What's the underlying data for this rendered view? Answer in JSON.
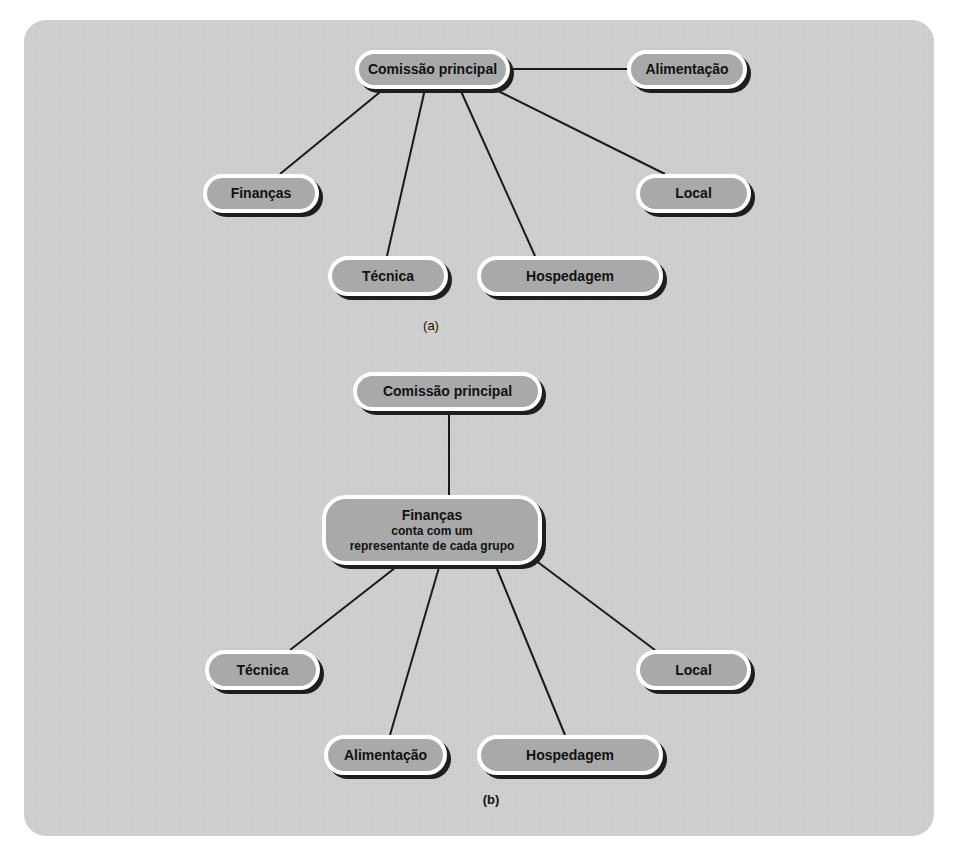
{
  "diagram_a": {
    "caption": "(a)",
    "nodes": {
      "root": "Comissão principal",
      "alimentacao": "Alimentação",
      "financas": "Finanças",
      "local": "Local",
      "tecnica": "Técnica",
      "hospedagem": "Hospedagem"
    }
  },
  "diagram_b": {
    "caption": "(b)",
    "nodes": {
      "root": "Comissão principal",
      "financas_title": "Finanças",
      "financas_line1": "conta com um",
      "financas_line2": "representante de cada grupo",
      "tecnica": "Técnica",
      "local": "Local",
      "alimentacao": "Alimentação",
      "hospedagem": "Hospedagem"
    }
  },
  "colors": {
    "panel": "#cfcfcf",
    "node_fill": "#a9a9a9",
    "node_border": "#ffffff",
    "shadow": "#1e1e1e",
    "line": "#1a1a1a"
  }
}
